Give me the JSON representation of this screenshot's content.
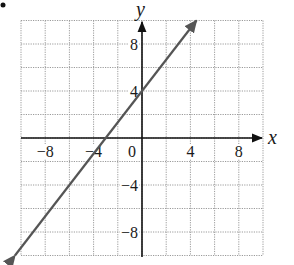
{
  "chart_data": {
    "type": "line",
    "title": "",
    "xlabel": "x",
    "ylabel": "y",
    "xlim": [
      -10,
      10
    ],
    "ylim": [
      -10,
      10
    ],
    "grid": true,
    "grid_step": 2,
    "x_ticks": [
      -8,
      -4,
      0,
      4,
      8
    ],
    "y_ticks": [
      8,
      4,
      -4,
      -8
    ],
    "x_tick_labels": [
      "−8",
      "−4",
      "0",
      "4",
      "8"
    ],
    "y_tick_labels": [
      "8",
      "4",
      "−4",
      "−8"
    ],
    "series": [
      {
        "name": "line",
        "equation": "y = (4/3)x + 4",
        "slope": 1.3333,
        "y_intercept": 4,
        "x_intercept": -3,
        "x": [
          -10.5,
          -6,
          -3,
          0,
          4.5
        ],
        "y": [
          -10,
          -4,
          0,
          4,
          10
        ],
        "arrows": "both",
        "color": "#555555"
      }
    ],
    "legend": null
  },
  "colors": {
    "axis": "#111111",
    "grid": "#9a9a9a",
    "line": "#555555"
  }
}
